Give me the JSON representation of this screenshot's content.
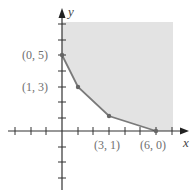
{
  "figure": {
    "type": "feasible-region-graph",
    "x_axis_label": "x",
    "y_axis_label": "y",
    "colors": {
      "region_fill": "#e3e3e3",
      "boundary": "#7a7a7a",
      "axes": "#333333",
      "labels": "#6f6f6f"
    },
    "vertices": [
      {
        "label": "(0, 5)",
        "x": 0,
        "y": 5
      },
      {
        "label": "(1, 3)",
        "x": 1,
        "y": 3
      },
      {
        "label": "(3, 1)",
        "x": 3,
        "y": 1
      },
      {
        "label": "(6, 0)",
        "x": 6,
        "y": 0
      }
    ],
    "x_ticks": [
      -3,
      -2,
      -1,
      1,
      2,
      3,
      4,
      5,
      6,
      7
    ],
    "y_ticks": [
      -4,
      -3,
      -2,
      -1,
      1,
      2,
      3,
      4,
      5,
      6
    ],
    "region": "unbounded above and to the right of the boundary through (0,5), (1,3), (3,1), (6,0)"
  }
}
